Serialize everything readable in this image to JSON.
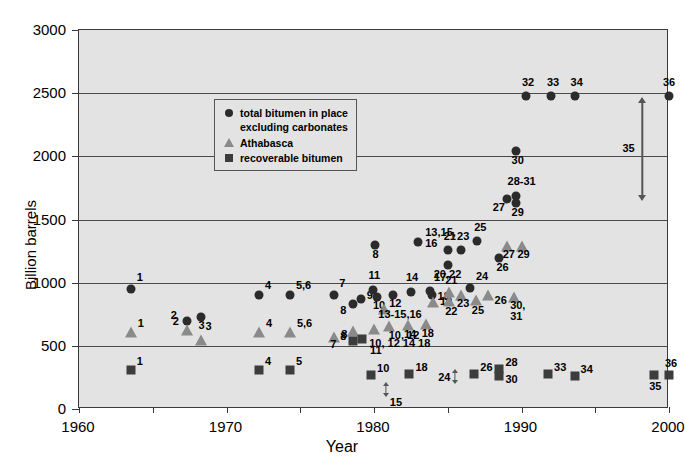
{
  "chart_data": {
    "type": "scatter",
    "title": "",
    "xlabel": "Year",
    "ylabel": "Billion barrels",
    "xlim": [
      1960,
      2000
    ],
    "ylim": [
      0,
      3000
    ],
    "xticks": [
      1960,
      1970,
      1980,
      1990,
      2000
    ],
    "xtick_labels": [
      "1960",
      "1970",
      "1980",
      "1990",
      "2000"
    ],
    "xminor_step": 5,
    "yticks": [
      0,
      500,
      1000,
      1500,
      2000,
      2500,
      3000
    ],
    "ytick_labels": [
      "0",
      "500",
      "1000",
      "1500",
      "2000",
      "2500",
      "3000"
    ],
    "grid": "horizontal",
    "legend_position": "upper-left-inside",
    "series": [
      {
        "name": "total bitumen in place excluding carbonates",
        "marker": "circle",
        "color": "#2b2b2b",
        "points": [
          {
            "label": "1",
            "x": 1963.5,
            "y": 950,
            "lx": 6,
            "ly": -11
          },
          {
            "label": "2",
            "x": 1967.3,
            "y": 700,
            "lx": -16,
            "ly": -5
          },
          {
            "label": "3",
            "x": 1968.3,
            "y": 730,
            "lx": -3,
            "ly": 9
          },
          {
            "label": "4",
            "x": 1972.2,
            "y": 900,
            "lx": 6,
            "ly": -9
          },
          {
            "label": "5,6",
            "x": 1974.3,
            "y": 900,
            "lx": 6,
            "ly": -9
          },
          {
            "label": "7",
            "x": 1977.3,
            "y": 905,
            "lx": 5,
            "ly": -11
          },
          {
            "label": "8",
            "x": 1978.6,
            "y": 830,
            "lx": -13,
            "ly": 7
          },
          {
            "label": "9",
            "x": 1979.1,
            "y": 870,
            "lx": 6,
            "ly": -3
          },
          {
            "label": "8",
            "x": 1980.1,
            "y": 1300,
            "lx": -3,
            "ly": 10
          },
          {
            "label": "11",
            "x": 1979.9,
            "y": 940,
            "lx": -4,
            "ly": -14
          },
          {
            "label": "10",
            "x": 1980.2,
            "y": 885,
            "lx": -4,
            "ly": 9
          },
          {
            "label": "12",
            "x": 1981.3,
            "y": 900,
            "lx": -4,
            "ly": 9
          },
          {
            "label": "13,15,\n16",
            "x": 1983.0,
            "y": 1325,
            "lx": 7,
            "ly": -9
          },
          {
            "label": "14",
            "x": 1982.5,
            "y": 930,
            "lx": -5,
            "ly": -14
          },
          {
            "label": "17",
            "x": 1983.8,
            "y": 935,
            "lx": 4,
            "ly": -13
          },
          {
            "label": "18",
            "x": 1983.9,
            "y": 905,
            "lx": 6,
            "ly": 2
          },
          {
            "label": "21",
            "x": 1985.0,
            "y": 1255,
            "lx": -4,
            "ly": -13
          },
          {
            "label": "23",
            "x": 1985.9,
            "y": 1255,
            "lx": -4,
            "ly": -13
          },
          {
            "label": "20,22",
            "x": 1985.0,
            "y": 1140,
            "lx": -14,
            "ly": 10
          },
          {
            "label": "25",
            "x": 1987.0,
            "y": 1330,
            "lx": -3,
            "ly": -13
          },
          {
            "label": "26",
            "x": 1988.5,
            "y": 1195,
            "lx": -3,
            "ly": 10
          },
          {
            "label": "24",
            "x": 1986.5,
            "y": 960,
            "lx": 6,
            "ly": -11
          },
          {
            "label": "27",
            "x": 1989.0,
            "y": 1660,
            "lx": -14,
            "ly": 9
          },
          {
            "label": "28-31",
            "x": 1989.6,
            "y": 1685,
            "lx": -8,
            "ly": -14
          },
          {
            "label": "29",
            "x": 1989.6,
            "y": 1630,
            "lx": -4,
            "ly": 10
          },
          {
            "label": "30",
            "x": 1989.6,
            "y": 2045,
            "lx": -4,
            "ly": 10
          },
          {
            "label": "32",
            "x": 1990.3,
            "y": 2480,
            "lx": -4,
            "ly": -13
          },
          {
            "label": "33",
            "x": 1992.0,
            "y": 2480,
            "lx": -4,
            "ly": -13
          },
          {
            "label": "34",
            "x": 1993.6,
            "y": 2480,
            "lx": -4,
            "ly": -13
          },
          {
            "label": "36",
            "x": 2000.0,
            "y": 2480,
            "lx": -6,
            "ly": -13
          }
        ]
      },
      {
        "name": "Athabasca",
        "marker": "triangle",
        "color": "#8a8a8a",
        "points": [
          {
            "label": "1",
            "x": 1963.5,
            "y": 610,
            "lx": 7,
            "ly": -8
          },
          {
            "label": "2",
            "x": 1967.3,
            "y": 625,
            "lx": -14,
            "ly": -8
          },
          {
            "label": "3",
            "x": 1968.3,
            "y": 545,
            "lx": 4,
            "ly": -13
          },
          {
            "label": "4",
            "x": 1972.2,
            "y": 610,
            "lx": 7,
            "ly": -8
          },
          {
            "label": "5,6",
            "x": 1974.3,
            "y": 610,
            "lx": 7,
            "ly": -8
          },
          {
            "label": "7",
            "x": 1977.3,
            "y": 570,
            "lx": -4,
            "ly": 8
          },
          {
            "label": "8",
            "x": 1978.6,
            "y": 620,
            "lx": -13,
            "ly": 6
          },
          {
            "label": "13-15,16",
            "x": 1980.7,
            "y": 790,
            "lx": -6,
            "ly": 6
          },
          {
            "label": "10, 12",
            "x": 1981.0,
            "y": 660,
            "lx": 0,
            "ly": 10
          },
          {
            "label": "11",
            "x": 1980.0,
            "y": 635,
            "lx": -4,
            "ly": 22
          },
          {
            "label": "14",
            "x": 1982.3,
            "y": 665,
            "lx": -4,
            "ly": 10
          },
          {
            "label": "18",
            "x": 1983.5,
            "y": 670,
            "lx": -4,
            "ly": 10
          },
          {
            "label": "19",
            "x": 1984.0,
            "y": 845,
            "lx": 7,
            "ly": 0
          },
          {
            "label": "21",
            "x": 1985.1,
            "y": 925,
            "lx": -4,
            "ly": -11
          },
          {
            "label": "22",
            "x": 1985.1,
            "y": 855,
            "lx": -4,
            "ly": 11
          },
          {
            "label": "23",
            "x": 1985.9,
            "y": 905,
            "lx": -4,
            "ly": 9
          },
          {
            "label": "25",
            "x": 1986.9,
            "y": 860,
            "lx": -4,
            "ly": 11
          },
          {
            "label": "26",
            "x": 1987.7,
            "y": 905,
            "lx": 7,
            "ly": 6
          },
          {
            "label": "27",
            "x": 1989.0,
            "y": 1290,
            "lx": -4,
            "ly": 9
          },
          {
            "label": "29",
            "x": 1990.0,
            "y": 1290,
            "lx": -4,
            "ly": 9
          },
          {
            "label": "30,\n31",
            "x": 1989.5,
            "y": 890,
            "lx": -4,
            "ly": 9
          }
        ]
      },
      {
        "name": "recoverable bitumen",
        "marker": "square",
        "color": "#3c3c3c",
        "points": [
          {
            "label": "1",
            "x": 1963.5,
            "y": 310,
            "lx": 6,
            "ly": -8
          },
          {
            "label": "4",
            "x": 1972.2,
            "y": 305,
            "lx": 6,
            "ly": -8
          },
          {
            "label": "5",
            "x": 1974.3,
            "y": 305,
            "lx": 6,
            "ly": -8
          },
          {
            "label": "8",
            "x": 1978.6,
            "y": 540,
            "lx": -12,
            "ly": -6
          },
          {
            "label": "10, 12 14 18",
            "x": 1979.2,
            "y": 555,
            "lx": 7,
            "ly": 5
          },
          {
            "label": "10",
            "x": 1979.8,
            "y": 270,
            "lx": 6,
            "ly": -6
          },
          {
            "label": "18",
            "x": 1982.4,
            "y": 275,
            "lx": 6,
            "ly": -6
          },
          {
            "label": "26",
            "x": 1986.8,
            "y": 275,
            "lx": 6,
            "ly": -6
          },
          {
            "label": "28",
            "x": 1988.5,
            "y": 320,
            "lx": 6,
            "ly": -6
          },
          {
            "label": "30",
            "x": 1988.5,
            "y": 265,
            "lx": 6,
            "ly": 4
          },
          {
            "label": "33",
            "x": 1991.8,
            "y": 275,
            "lx": 6,
            "ly": -6
          },
          {
            "label": "34",
            "x": 1993.6,
            "y": 265,
            "lx": 6,
            "ly": -6
          },
          {
            "label": "35",
            "x": 1999.0,
            "y": 270,
            "lx": -5,
            "ly": 12
          },
          {
            "label": "36",
            "x": 2000.0,
            "y": 270,
            "lx": -4,
            "ly": -11
          }
        ]
      }
    ],
    "annotations": [
      {
        "name": "range-arrow-35",
        "label": "35",
        "x": 1998.2,
        "y_low": 1650,
        "y_high": 2470,
        "size": "large",
        "label_dx": -20,
        "label_dy": 0
      },
      {
        "name": "range-arrow-24",
        "label": "24",
        "x": 1985.5,
        "y_low": 195,
        "y_high": 320,
        "size": "small",
        "label_dx": -17,
        "label_dy": 2
      },
      {
        "name": "range-arrow-15",
        "label": "15",
        "x": 1980.8,
        "y_low": 95,
        "y_high": 215,
        "size": "small",
        "label_dx": 4,
        "label_dy": 14
      }
    ]
  },
  "legend": {
    "rows": [
      {
        "symbol": "circle-marker",
        "label": "total bitumen in place"
      },
      {
        "symbol": "continuation",
        "label": "excluding carbonates"
      },
      {
        "symbol": "triangle-marker",
        "label": "Athabasca"
      },
      {
        "symbol": "square-marker",
        "label": "recoverable bitumen"
      }
    ]
  },
  "axes": {
    "x_title": "Year",
    "y_title": "Billion barrels"
  }
}
